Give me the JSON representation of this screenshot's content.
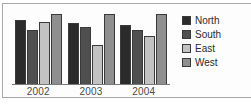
{
  "chart_data": {
    "type": "bar",
    "title": "",
    "subtitle": "",
    "xlabel": "",
    "ylabel": "",
    "categories": [
      "2002",
      "2003",
      "2004"
    ],
    "series": [
      {
        "name": "North",
        "color": "#2b2b2b",
        "values": [
          85,
          80,
          78
        ]
      },
      {
        "name": "South",
        "color": "#4f4f4f",
        "values": [
          72,
          75,
          72
        ]
      },
      {
        "name": "East",
        "color": "#c2c2c2",
        "values": [
          82,
          52,
          63
        ]
      },
      {
        "name": "West",
        "color": "#8f8f8f",
        "values": [
          92,
          92,
          92
        ]
      }
    ],
    "ylim": [
      0,
      100
    ],
    "grid": false,
    "legend_position": "right",
    "axis_labels_visible": false
  },
  "legend": {
    "items": [
      {
        "label": "North",
        "color": "#2b2b2b"
      },
      {
        "label": "South",
        "color": "#4f4f4f"
      },
      {
        "label": "East",
        "color": "#c2c2c2"
      },
      {
        "label": "West",
        "color": "#8f8f8f"
      }
    ]
  },
  "colors": {
    "frame_border": "#a8a8a8",
    "axis_line": "#7a7a7a",
    "bar_outline": "#3a3a3a",
    "background": "#ffffff",
    "tick_text": "#4a4a4a",
    "legend_text": "#2b2b2b"
  }
}
